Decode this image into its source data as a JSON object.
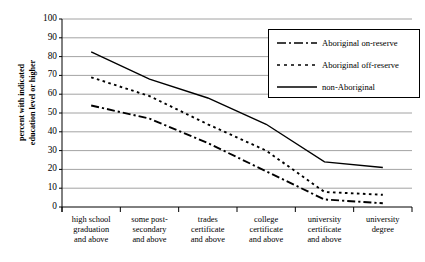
{
  "chart_data": {
    "type": "line",
    "title": "",
    "xlabel": "",
    "ylabel": "percent with indicated education level or higher",
    "ylabel_line1": "percent with indicated",
    "ylabel_line2": "education level or higher",
    "ylim": [
      0,
      100
    ],
    "ytick_step": 10,
    "yticks": [
      "100",
      "90",
      "80",
      "70",
      "60",
      "50",
      "40",
      "30",
      "20",
      "10",
      "0"
    ],
    "grid": true,
    "legend_position": "top-right",
    "categories": [
      "high school graduation and above",
      "some post-secondary and above",
      "trades certificate and above",
      "college certificate and above",
      "university certificate and above",
      "university degree"
    ],
    "category_lines": [
      [
        "high school",
        "graduation",
        "and above"
      ],
      [
        "some post-",
        "secondary",
        "and above"
      ],
      [
        "trades",
        "certificate",
        "and above"
      ],
      [
        "college",
        "certificate",
        "and above"
      ],
      [
        "university",
        "certificate",
        "and above"
      ],
      [
        "university",
        "degree"
      ]
    ],
    "series": [
      {
        "name": "Aboriginal on-reserve",
        "style": "dash-dot",
        "color": "#000000",
        "values": [
          54,
          47,
          34,
          19,
          4,
          2
        ]
      },
      {
        "name": "Aboriginal off-reserve",
        "style": "dotted",
        "color": "#000000",
        "values": [
          69,
          59,
          44,
          30,
          8,
          6.5
        ]
      },
      {
        "name": "non-Aboriginal",
        "style": "solid",
        "color": "#000000",
        "values": [
          82.5,
          68,
          58,
          44,
          24,
          21
        ]
      }
    ]
  },
  "legend": {
    "entries": [
      {
        "label": "Aboriginal on-reserve",
        "style": "dash-dot"
      },
      {
        "label": "Aboriginal off-reserve",
        "style": "dotted"
      },
      {
        "label": "non-Aboriginal",
        "style": "solid"
      }
    ]
  }
}
